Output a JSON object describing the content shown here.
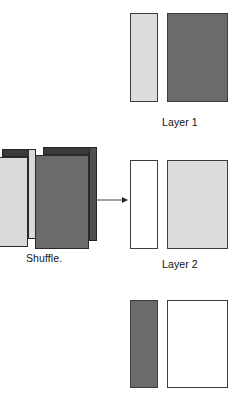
{
  "canvas": {
    "width": 242,
    "height": 398,
    "background": "#ffffff"
  },
  "colors": {
    "dark_gray": "#6b6b6b",
    "dark_gray_top": "#3a3a3a",
    "dark_gray_side": "#4f4f4f",
    "light_gray": "#d9d9d9",
    "light_gray_pale": "#dcdcdc",
    "white": "#ffffff",
    "outline": "#3d3d3d",
    "arrow": "#4a4a4a",
    "text": "#111111"
  },
  "diagram": {
    "title": "",
    "arrow": {
      "name": "shuffle-arrow",
      "direction": "right",
      "x": 95,
      "y": 200,
      "length": 33
    },
    "shuffle": {
      "label": "Shuffle.",
      "blocks": [
        {
          "name": "light-block",
          "fill": "light_gray",
          "top_fill": "dark_gray_top",
          "side_fill": "light_gray",
          "x": -6,
          "y": 157,
          "width": 34,
          "height": 90,
          "depth": 8
        },
        {
          "name": "dark-block",
          "fill": "dark_gray",
          "top_fill": "dark_gray_top",
          "side_fill": "dark_gray_side",
          "x": 35,
          "y": 155,
          "width": 54,
          "height": 94,
          "depth": 8
        }
      ]
    },
    "groups": [
      {
        "name": "layer-1",
        "label": "Layer 1",
        "label_x": 162,
        "label_y": 116,
        "y": 13,
        "height": 89,
        "cards": [
          {
            "name": "card-narrow",
            "role": "narrow",
            "fill": "light_gray_pale",
            "x": 130,
            "width": 28
          },
          {
            "name": "card-wide",
            "role": "wide",
            "fill": "dark_gray",
            "x": 167,
            "width": 61
          }
        ]
      },
      {
        "name": "layer-2",
        "label": "Layer 2",
        "label_x": 162,
        "label_y": 258,
        "y": 160,
        "height": 89,
        "cards": [
          {
            "name": "card-narrow",
            "role": "narrow",
            "fill": "white",
            "x": 130,
            "width": 28
          },
          {
            "name": "card-wide",
            "role": "wide",
            "fill": "light_gray_pale",
            "x": 167,
            "width": 61
          }
        ]
      },
      {
        "name": "layer-3",
        "label": "",
        "label_x": 162,
        "label_y": 402,
        "y": 300,
        "height": 88,
        "cards": [
          {
            "name": "card-narrow",
            "role": "narrow",
            "fill": "dark_gray",
            "x": 130,
            "width": 28
          },
          {
            "name": "card-wide",
            "role": "wide",
            "fill": "white",
            "x": 167,
            "width": 61
          }
        ]
      }
    ]
  }
}
